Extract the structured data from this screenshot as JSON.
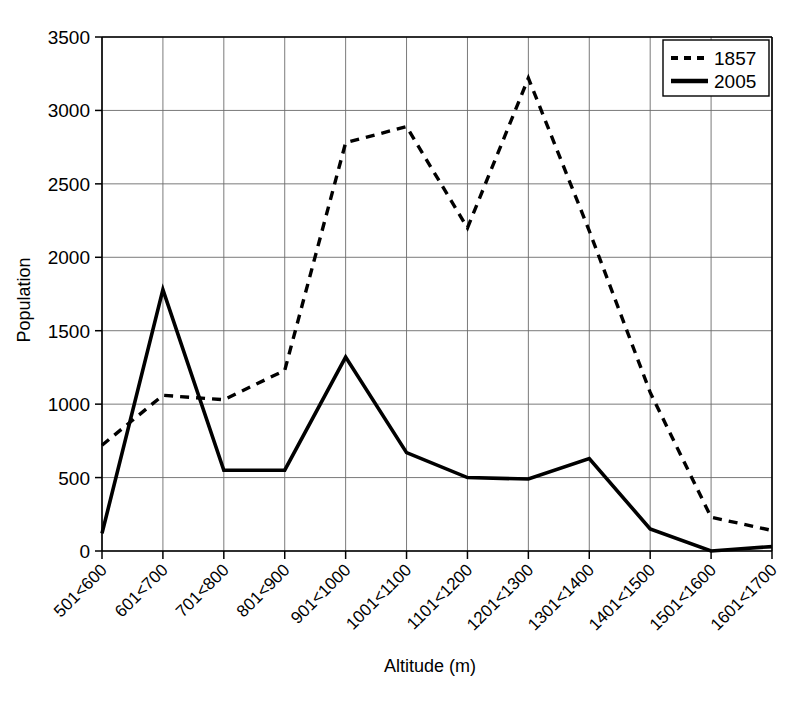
{
  "chart_data": {
    "type": "line",
    "title": "",
    "xlabel": "Altitude (m)",
    "ylabel": "Population",
    "categories": [
      "501<600",
      "601<700",
      "701<800",
      "801<900",
      "901<1000",
      "1001<1100",
      "1101<1200",
      "1201<1300",
      "1301<1400",
      "1401<1500",
      "1501<1600",
      "1601<1700"
    ],
    "series": [
      {
        "name": "1857",
        "style": "dashed",
        "color": "#000000",
        "values": [
          720,
          1060,
          1030,
          1230,
          2780,
          2890,
          2200,
          3220,
          2180,
          1080,
          230,
          140
        ]
      },
      {
        "name": "2005",
        "style": "solid",
        "color": "#000000",
        "values": [
          120,
          1780,
          550,
          550,
          1320,
          670,
          500,
          490,
          630,
          150,
          0,
          30
        ]
      }
    ],
    "ylim": [
      0,
      3500
    ],
    "yticks": [
      0,
      500,
      1000,
      1500,
      2000,
      2500,
      3000,
      3500
    ],
    "ytick_labels": [
      "0",
      "500",
      "1000",
      "1500",
      "2000",
      "2500",
      "3000",
      "3500"
    ],
    "grid": true,
    "grid_axes": "both",
    "legend_position": "top-right",
    "legend_entries": [
      "1857",
      "2005"
    ]
  }
}
